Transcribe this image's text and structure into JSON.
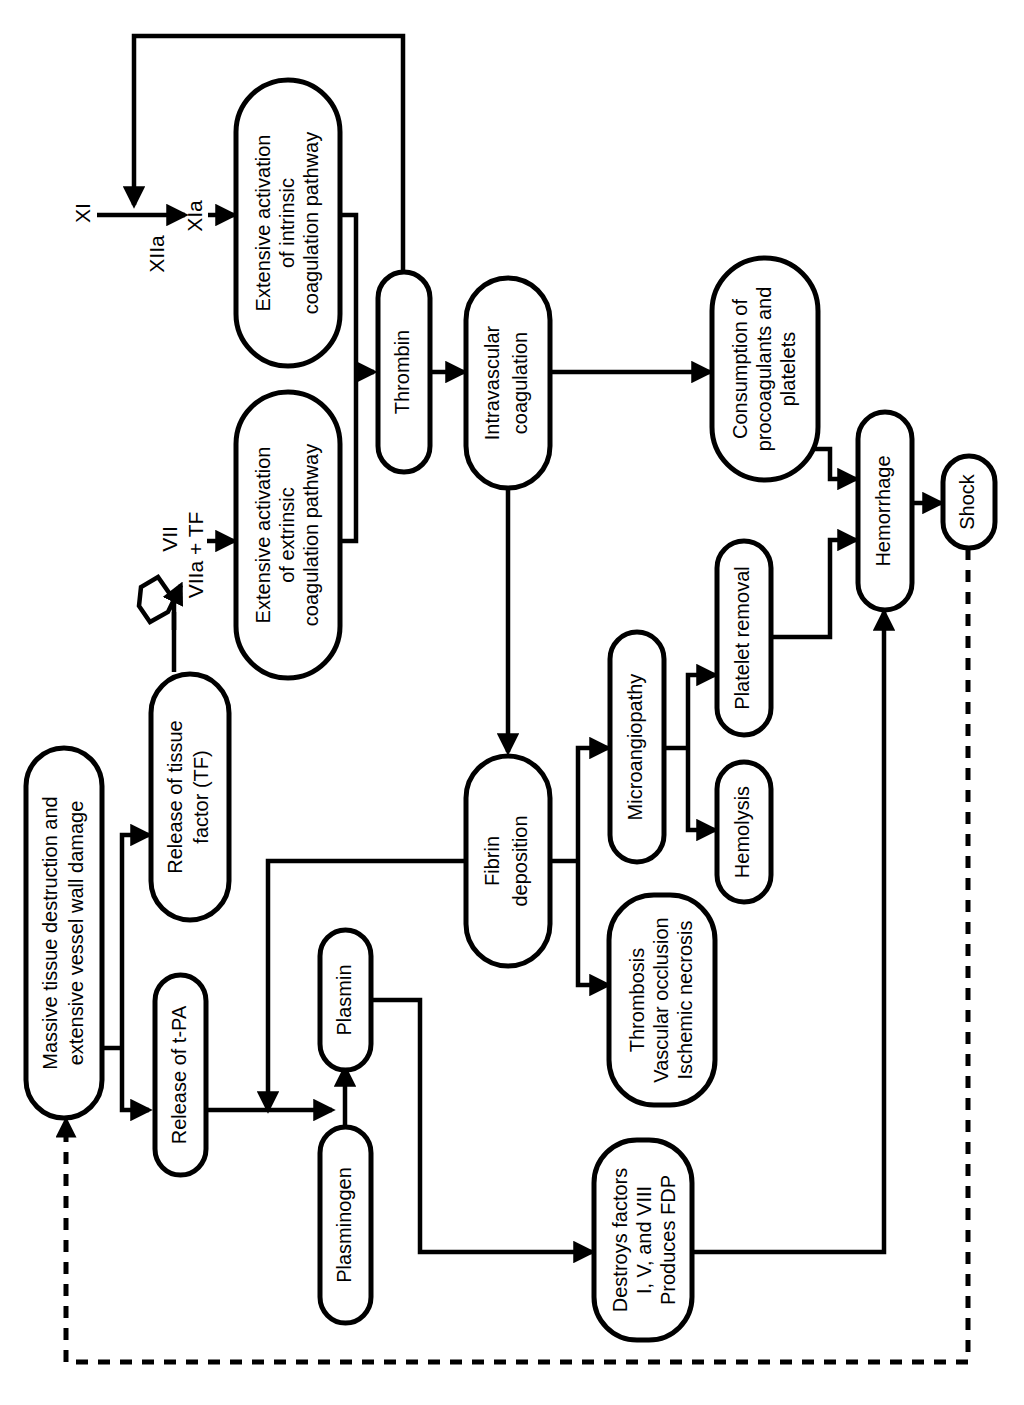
{
  "diagram": {
    "orientation": "rotated-90-ccw",
    "line_color": "#000000",
    "box_fill": "#ffffff",
    "nodes": [
      {
        "id": "massive",
        "label": "Massive tissue destruction and\nextensive vessel wall damage",
        "lines": [
          "Massive tissue destruction and",
          "extensive vessel wall damage"
        ]
      },
      {
        "id": "tf",
        "label": "Release of tissue\nfactor (TF)",
        "lines": [
          "Release of tissue",
          "factor (TF)"
        ]
      },
      {
        "id": "tpa",
        "label": "Release of t-PA",
        "lines": [
          "Release of t-PA"
        ]
      },
      {
        "id": "extrinsic",
        "label": "Extensive activation\nof extrinsic\ncoagulation pathway",
        "lines": [
          "Extensive activation",
          "of extrinsic",
          "coagulation pathway"
        ]
      },
      {
        "id": "intrinsic",
        "label": "Extensive activation\nof intrinsic\ncoagulation pathway",
        "lines": [
          "Extensive activation",
          "of intrinsic",
          "coagulation pathway"
        ]
      },
      {
        "id": "thrombin",
        "label": "Thrombin",
        "lines": [
          "Thrombin"
        ]
      },
      {
        "id": "intravascular",
        "label": "Intravascular\ncoagulation",
        "lines": [
          "Intravascular",
          "coagulation"
        ]
      },
      {
        "id": "consumption",
        "label": "Consumption of\nprocoagulants and\nplatelets",
        "lines": [
          "Consumption of",
          "procoagulants and",
          "platelets"
        ]
      },
      {
        "id": "hemorrhage",
        "label": "Hemorrhage",
        "lines": [
          "Hemorrhage"
        ]
      },
      {
        "id": "shock",
        "label": "Shock",
        "lines": [
          "Shock"
        ]
      },
      {
        "id": "fibrin",
        "label": "Fibrin\ndeposition",
        "lines": [
          "Fibrin",
          "deposition"
        ]
      },
      {
        "id": "microangiopathy",
        "label": "Microangiopathy",
        "lines": [
          "Microangiopathy"
        ]
      },
      {
        "id": "platelet_removal",
        "label": "Platelet removal",
        "lines": [
          "Platelet removal"
        ]
      },
      {
        "id": "hemolysis",
        "label": "Hemolysis",
        "lines": [
          "Hemolysis"
        ]
      },
      {
        "id": "thrombosis",
        "label": "Thrombosis\nVascular occlusion\nIschemic necrosis",
        "lines": [
          "Thrombosis",
          "Vascular occlusion",
          "Ischemic necrosis"
        ]
      },
      {
        "id": "plasminogen",
        "label": "Plasminogen",
        "lines": [
          "Plasminogen"
        ]
      },
      {
        "id": "plasmin",
        "label": "Plasmin",
        "lines": [
          "Plasmin"
        ]
      },
      {
        "id": "destroys",
        "label": "Destroys factors\nI, V, and VIII\nProduces FDP",
        "lines": [
          "Destroys factors",
          "I, V, and VIII",
          "Produces FDP"
        ]
      }
    ],
    "factor_labels": [
      {
        "id": "xi",
        "label": "XI"
      },
      {
        "id": "xiia",
        "label": "XIIa"
      },
      {
        "id": "xia",
        "label": "XIa"
      },
      {
        "id": "vii",
        "label": "VII"
      },
      {
        "id": "viia_tf",
        "label": "VIIa + TF"
      }
    ],
    "edges": [
      {
        "from": "massive",
        "to": "tf",
        "style": "solid"
      },
      {
        "from": "massive",
        "to": "tpa",
        "style": "solid"
      },
      {
        "from": "tf",
        "to": "viia_tf",
        "style": "solid-curved"
      },
      {
        "from": "viia_tf",
        "to": "extrinsic",
        "style": "solid"
      },
      {
        "from": "xi",
        "to": "xia",
        "style": "solid",
        "label": "XIIa"
      },
      {
        "from": "xia",
        "to": "intrinsic",
        "style": "solid"
      },
      {
        "from": "extrinsic",
        "to": "thrombin",
        "style": "solid"
      },
      {
        "from": "intrinsic",
        "to": "thrombin",
        "style": "solid"
      },
      {
        "from": "thrombin",
        "to": "intravascular",
        "style": "solid"
      },
      {
        "from": "thrombin",
        "to": "xiia",
        "style": "solid-feedback"
      },
      {
        "from": "intravascular",
        "to": "consumption",
        "style": "solid"
      },
      {
        "from": "intravascular",
        "to": "fibrin",
        "style": "solid"
      },
      {
        "from": "consumption",
        "to": "hemorrhage",
        "style": "solid"
      },
      {
        "from": "hemorrhage",
        "to": "shock",
        "style": "solid"
      },
      {
        "from": "fibrin",
        "to": "microangiopathy",
        "style": "solid"
      },
      {
        "from": "fibrin",
        "to": "thrombosis",
        "style": "solid"
      },
      {
        "from": "fibrin",
        "to": "plasminogen_arrow",
        "style": "solid"
      },
      {
        "from": "microangiopathy",
        "to": "platelet_removal",
        "style": "solid"
      },
      {
        "from": "microangiopathy",
        "to": "hemolysis",
        "style": "solid"
      },
      {
        "from": "platelet_removal",
        "to": "hemorrhage",
        "style": "solid"
      },
      {
        "from": "tpa",
        "to": "plasminogen_arrow",
        "style": "solid"
      },
      {
        "from": "plasminogen",
        "to": "plasmin",
        "style": "solid"
      },
      {
        "from": "plasmin",
        "to": "destroys",
        "style": "solid"
      },
      {
        "from": "destroys",
        "to": "hemorrhage",
        "style": "solid"
      },
      {
        "from": "shock",
        "to": "massive",
        "style": "dashed"
      }
    ]
  }
}
